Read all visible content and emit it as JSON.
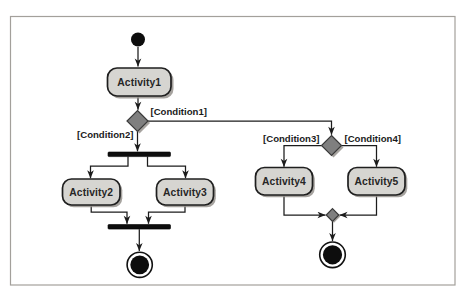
{
  "figure": {
    "type": "uml-activity-diagram"
  },
  "colors": {
    "page_bg": "#ffffff",
    "frame_border": "#a3a09b",
    "activity_fill": "#d6d5d1",
    "activity_border": "#1f1f1f",
    "shadow": "#96938e",
    "diamond_fill": "#7f7f7f",
    "node_black": "#0d0d0d",
    "edge": "#1c1c1c"
  },
  "activities": {
    "activity1": "Activity1",
    "activity2": "Activity2",
    "activity3": "Activity3",
    "activity4": "Activity4",
    "activity5": "Activity5"
  },
  "guards": {
    "condition1": "[Condition1]",
    "condition2": "[Condition2]",
    "condition3": "[Condition3]",
    "condition4": "[Condition4]"
  },
  "symbols": {
    "initial": "initial-node-icon",
    "decision1": "decision-diamond-icon",
    "decision2": "decision-diamond-icon",
    "merge": "merge-diamond-icon",
    "fork": "fork-bar-icon",
    "join": "join-bar-icon",
    "final_left": "activity-final-node-icon",
    "final_right": "activity-final-node-icon"
  }
}
